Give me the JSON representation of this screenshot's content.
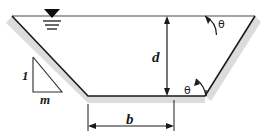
{
  "figure": {
    "labels": {
      "depth": "d",
      "bottom_width": "b",
      "side_slope_run": "m",
      "side_slope_rise": "1",
      "angle_top": "θ",
      "angle_bottom": "θ"
    },
    "symbols": {
      "water_surface": "water-level-triangle"
    },
    "colors": {
      "line": "#1a1a1a",
      "shadow": "#d8d8d8",
      "background": "#ffffff"
    }
  }
}
